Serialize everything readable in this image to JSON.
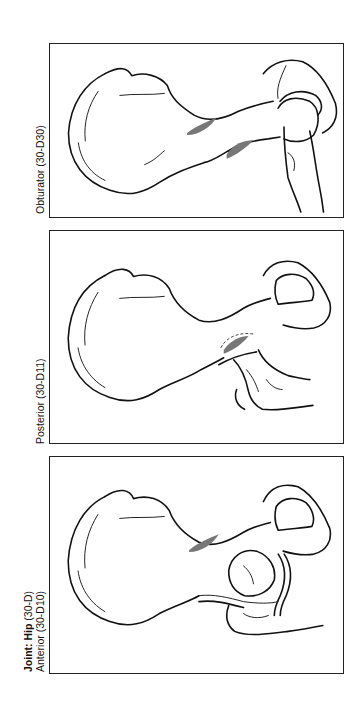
{
  "figure": {
    "panels": [
      {
        "id": "obturator",
        "label": "Obturator (30-D30)"
      },
      {
        "id": "posterior",
        "label": "Posterior (30-D11)"
      },
      {
        "id": "anterior",
        "title_prefix": "Joint: Hip",
        "title_code": "(30-D)",
        "label": "Anterior (30-D10)"
      }
    ]
  }
}
